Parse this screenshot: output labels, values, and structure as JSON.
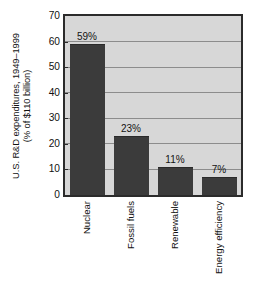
{
  "chart_data": {
    "type": "bar",
    "title": "",
    "subtitle": "",
    "xlabel": "",
    "ylabel": "U.S. R&D expenditures, 1949–1999 (% of $110 billion)",
    "ylabel_line1": "U.S. R&D expenditures, 1949–1999",
    "ylabel_line2": "(% of $110 billion)",
    "categories": [
      "Nuclear",
      "Fossil fuels",
      "Renewable",
      "Energy efficiency"
    ],
    "values": [
      59,
      23,
      11,
      7
    ],
    "value_labels": [
      "59%",
      "23%",
      "11%",
      "7%"
    ],
    "ylim": [
      0,
      70
    ],
    "ytick_labels": [
      "0",
      "10",
      "20",
      "30",
      "40",
      "50",
      "60",
      "70"
    ],
    "ytick_values": [
      0,
      10,
      20,
      30,
      40,
      50,
      60,
      70
    ],
    "grid": true,
    "grid_axis": "y",
    "legend": false,
    "legend_position": "none",
    "colors": {
      "bar_fill": "#3b3b3b",
      "plot_background": "#d7d7d7",
      "gridline": "#8c8c8c",
      "axis_border": "#2b2b2b",
      "text": "#111111",
      "page_background": "#ffffff"
    }
  }
}
